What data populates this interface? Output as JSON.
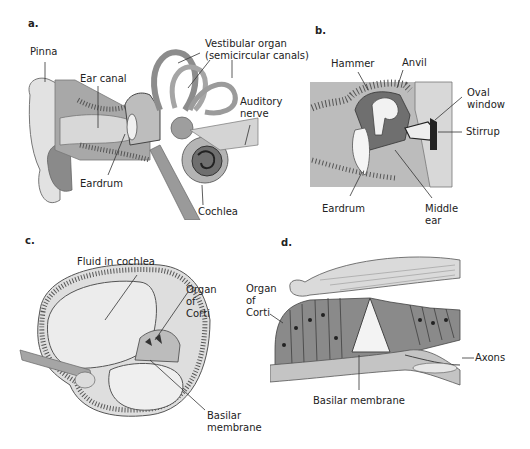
{
  "figure": {
    "panels": [
      {
        "id": "a",
        "label": "a.",
        "title": "Outer, middle and inner ear",
        "annotations": {
          "pinna": "Pinna",
          "ear_canal": "Ear canal",
          "vestibular_organ": "Vestibular organ\n(semicircular canals)",
          "auditory_nerve": "Auditory\nnerve",
          "eardrum": "Eardrum",
          "cochlea": "Cochlea"
        }
      },
      {
        "id": "b",
        "label": "b.",
        "title": "Middle ear ossicles",
        "annotations": {
          "hammer": "Hammer",
          "anvil": "Anvil",
          "oval_window": "Oval\nwindow",
          "stirrup": "Stirrup",
          "eardrum": "Eardrum",
          "middle_ear": "Middle\near"
        }
      },
      {
        "id": "c",
        "label": "c.",
        "title": "Cross-section of cochlea",
        "annotations": {
          "fluid": "Fluid in cochlea",
          "organ_of_corti": "Organ\nof\nCorti",
          "basilar_membrane": "Basilar\nmembrane"
        }
      },
      {
        "id": "d",
        "label": "d.",
        "title": "Organ of Corti detail",
        "annotations": {
          "organ_of_corti": "Organ\nof\nCorti",
          "axons": "Axons",
          "basilar_membrane": "Basilar membrane"
        }
      }
    ],
    "colors": {
      "tissue_dark": "#6e6e6e",
      "tissue_mid": "#9a9a9a",
      "tissue_light": "#c8c8c8",
      "fluid": "#e6e6e6",
      "bone_dots": "#555555",
      "leader_line": "#333333"
    }
  }
}
